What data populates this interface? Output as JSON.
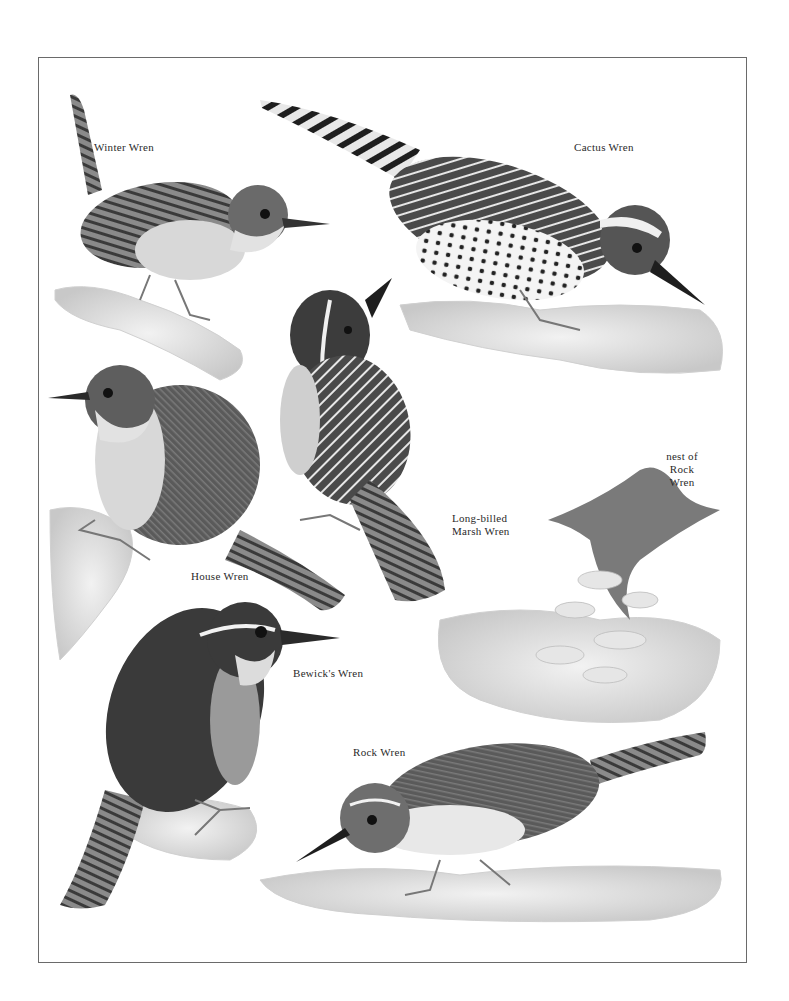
{
  "plate": {
    "style": "grayscale illustrated field-guide plate",
    "colors": {
      "ink": "#2a2a2a",
      "frame": "#6a6a6a",
      "dark_plumage": "#3c3c3c",
      "mid_plumage": "#6e6e6e",
      "light_plumage": "#bdbdbd",
      "rock_shadow": "#cfcfcf"
    }
  },
  "labels": {
    "winter_wren": "Winter Wren",
    "cactus_wren": "Cactus Wren",
    "nest_line1": "nest of",
    "nest_line2": "Rock",
    "nest_line3": "Wren",
    "marsh_line1": "Long-billed",
    "marsh_line2": "Marsh Wren",
    "house_wren": "House Wren",
    "bewicks_wren": "Bewick's Wren",
    "rock_wren": "Rock Wren"
  },
  "birds": [
    {
      "name": "Winter Wren",
      "pose": "perched, tail cocked up"
    },
    {
      "name": "Cactus Wren",
      "pose": "leaning forward, spotted breast, barred tail"
    },
    {
      "name": "Long-billed Marsh Wren",
      "pose": "head tilted upward, streaked back"
    },
    {
      "name": "House Wren",
      "pose": "perched on branch facing left"
    },
    {
      "name": "Bewick's Wren",
      "pose": "upright, long barred tail, white eyebrow"
    },
    {
      "name": "Rock Wren",
      "pose": "crouched on rocks facing left"
    }
  ]
}
